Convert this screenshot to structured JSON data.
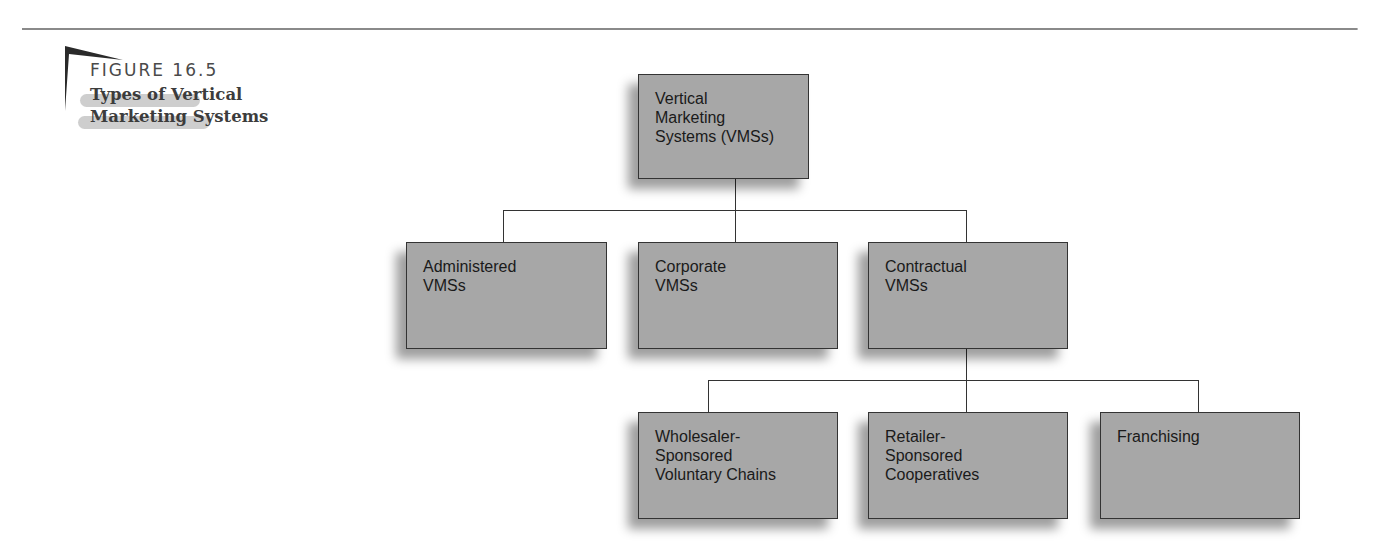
{
  "figure": {
    "label": "FIGURE 16.5",
    "title_lines": [
      "Types of Vertical",
      "Marketing Systems"
    ]
  },
  "diagram": {
    "root": {
      "lines": [
        "Vertical",
        "Marketing",
        "Systems (VMSs)"
      ]
    },
    "level2": [
      {
        "lines": [
          "Administered",
          "VMSs"
        ]
      },
      {
        "lines": [
          "Corporate",
          "VMSs"
        ]
      },
      {
        "lines": [
          "Contractual",
          "VMSs"
        ]
      }
    ],
    "level3": [
      {
        "lines": [
          "Wholesaler-",
          "Sponsored",
          "Voluntary Chains"
        ]
      },
      {
        "lines": [
          "Retailer-",
          "Sponsored",
          "Cooperatives"
        ]
      },
      {
        "lines": [
          "Franchising"
        ]
      }
    ],
    "colors": {
      "box_fill": "#a7a7a7",
      "border": "#333333",
      "rule": "#8a8a8a"
    }
  }
}
